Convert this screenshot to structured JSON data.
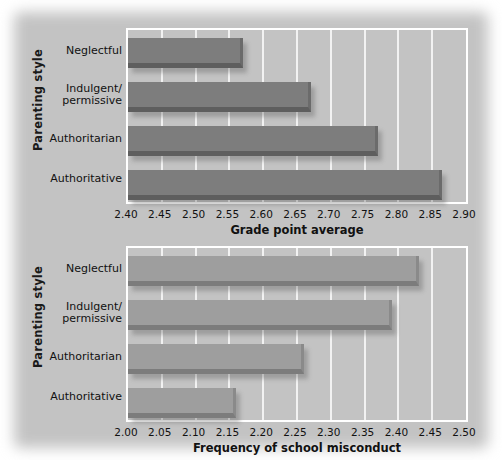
{
  "figure": {
    "background_color": "#c3c3c3",
    "panel_color": "#c3c3c3"
  },
  "chart_data": [
    {
      "id": "grade-point-average",
      "type": "bar",
      "orientation": "horizontal",
      "title": "",
      "xlabel": "Grade point average",
      "ylabel": "Parenting style",
      "xlim": [
        2.4,
        2.9
      ],
      "xticks": [
        "2.40",
        "2.45",
        "2.50",
        "2.55",
        "2.60",
        "2.65",
        "2.70",
        "2.75",
        "2.80",
        "2.85",
        "2.90"
      ],
      "xtick_values": [
        2.4,
        2.45,
        2.5,
        2.55,
        2.6,
        2.65,
        2.7,
        2.75,
        2.8,
        2.85,
        2.9
      ],
      "grid": true,
      "legend": "none",
      "bar_color": "#7d7d7d",
      "categories": [
        "Neglectful",
        "Indulgent/ permissive",
        "Authoritarian",
        "Authoritative"
      ],
      "category_lines": [
        [
          "Neglectful"
        ],
        [
          "Indulgent/",
          "permissive"
        ],
        [
          "Authoritarian"
        ],
        [
          "Authoritative"
        ]
      ],
      "values": [
        2.57,
        2.67,
        2.77,
        2.865
      ]
    },
    {
      "id": "frequency-of-school-misconduct",
      "type": "bar",
      "orientation": "horizontal",
      "title": "",
      "xlabel": "Frequency of school misconduct",
      "ylabel": "Parenting style",
      "xlim": [
        2.0,
        2.5
      ],
      "xticks": [
        "2.00",
        "2.05",
        "2.10",
        "2.15",
        "2.20",
        "2.25",
        "2.30",
        "2.35",
        "2.40",
        "2.45",
        "2.50"
      ],
      "xtick_values": [
        2.0,
        2.05,
        2.1,
        2.15,
        2.2,
        2.25,
        2.3,
        2.35,
        2.4,
        2.45,
        2.5
      ],
      "grid": true,
      "legend": "none",
      "bar_color": "#9e9e9e",
      "categories": [
        "Neglectful",
        "Indulgent/ permissive",
        "Authoritarian",
        "Authoritative"
      ],
      "category_lines": [
        [
          "Neglectful"
        ],
        [
          "Indulgent/",
          "permissive"
        ],
        [
          "Authoritarian"
        ],
        [
          "Authoritative"
        ]
      ],
      "values": [
        2.43,
        2.39,
        2.26,
        2.16
      ]
    }
  ]
}
